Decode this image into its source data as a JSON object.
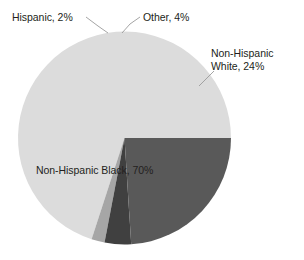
{
  "chart_data": {
    "type": "pie",
    "title": "",
    "subtitle": "",
    "xlabel": "",
    "ylabel": "",
    "legend_position": "none",
    "grid": false,
    "categories": [
      "Non-Hispanic Black",
      "Non-Hispanic White",
      "Other",
      "Hispanic"
    ],
    "values": [
      70,
      24,
      4,
      2
    ],
    "unit": "%",
    "slices": [
      {
        "name": "Non-Hispanic Black",
        "value": 70,
        "label": "Non-Hispanic Black, 70%",
        "color": "#dcdcdc",
        "label_placement": "inside",
        "start_pct": 0,
        "end_pct": 70
      },
      {
        "name": "Hispanic",
        "value": 2,
        "label": "Hispanic, 2%",
        "color": "#a6a6a6",
        "label_placement": "outside-leader",
        "start_pct": 70,
        "end_pct": 72
      },
      {
        "name": "Other",
        "value": 4,
        "label": "Other, 4%",
        "color": "#404040",
        "label_placement": "outside-leader",
        "start_pct": 72,
        "end_pct": 76
      },
      {
        "name": "Non-Hispanic White",
        "value": 24,
        "label_line1": "Non-Hispanic",
        "label_line2": "White, 24%",
        "label": "Non-Hispanic White, 24%",
        "color": "#595959",
        "label_placement": "outside-leader",
        "start_pct": 76,
        "end_pct": 100
      }
    ]
  },
  "labels": {
    "hispanic": "Hispanic, 2%",
    "other": "Other, 4%",
    "nhwhite_line1": "Non-Hispanic",
    "nhwhite_line2": "White, 24%",
    "nhblack": "Non-Hispanic Black, 70%"
  },
  "style": {
    "background": "#ffffff",
    "text_color": "#231f20",
    "leader_color": "#9a9a9a"
  }
}
